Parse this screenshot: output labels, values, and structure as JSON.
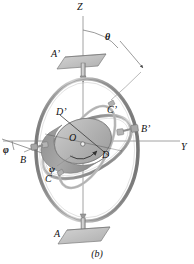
{
  "figure": {
    "caption": "(b)",
    "axes": {
      "z_label": "Z",
      "y_label": "Y"
    },
    "angles": [
      {
        "name": "theta-angle-label",
        "symbol": "θ",
        "x": 118,
        "y": 26
      },
      {
        "name": "phi-angle-label",
        "symbol": "φ",
        "x": 4,
        "y": 146
      },
      {
        "name": "psi-angle-label",
        "symbol": "ψ",
        "x": 50,
        "y": 168
      }
    ],
    "points": [
      {
        "name": "point-label-a-prime",
        "text": "A’",
        "x": 53,
        "y": 50
      },
      {
        "name": "point-label-a",
        "text": "A",
        "x": 56,
        "y": 232
      },
      {
        "name": "point-label-b",
        "text": "B",
        "x": 22,
        "y": 158
      },
      {
        "name": "point-label-b-prime",
        "text": "B’",
        "x": 143,
        "y": 126
      },
      {
        "name": "point-label-c",
        "text": "C",
        "x": 47,
        "y": 177
      },
      {
        "name": "point-label-c-prime",
        "text": "C’",
        "x": 110,
        "y": 108
      },
      {
        "name": "point-label-d",
        "text": "D",
        "x": 104,
        "y": 153
      },
      {
        "name": "point-label-d-prime",
        "text": "D’",
        "x": 58,
        "y": 110
      },
      {
        "name": "point-label-o",
        "text": "O",
        "x": 71,
        "y": 138
      }
    ],
    "colors": {
      "outline": "#8f8f8f",
      "ring_outer": "#a6a6a6",
      "ring_inner": "#b5b5b5",
      "rotor_face": "#b9b9b9",
      "rotor_rim": "#9a9a9a",
      "plate": "#c0c0c0",
      "axis_line": "#8a8a8a",
      "text": "#111111"
    }
  }
}
